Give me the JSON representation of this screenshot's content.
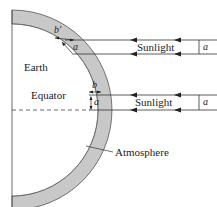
{
  "diagram": {
    "labels": {
      "earth": "Earth",
      "equator": "Equator",
      "atmosphere": "Atmosphere",
      "sunlight_upper": "Sunlight",
      "sunlight_lower": "Sunlight",
      "a_upper_beam": "a",
      "a_lower_beam": "a",
      "a_upper_path": "a",
      "a_equator_path": "a",
      "b_prime": "b′",
      "b": "b"
    },
    "colors": {
      "atmosphere_fill": "#c8c8c8",
      "line": "#333333",
      "background": "#ffffff"
    }
  }
}
